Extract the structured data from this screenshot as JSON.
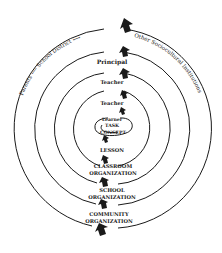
{
  "diagram": {
    "type": "concentric-circles",
    "center_spiral": {
      "lines": [
        "Learner",
        "TASK",
        "CONCEPT"
      ]
    },
    "top_labels": {
      "ring1": "Teacher",
      "ring2": "Teacher",
      "ring3": "Principal",
      "ring4_left_1": "Parents",
      "ring4_left_2": "School District",
      "ring4_right": "Other Sociocultural Institutions"
    },
    "bottom_labels": {
      "ring1": "LESSON",
      "ring2_line1": "CLASSROOM",
      "ring2_line2": "ORGANIZATION",
      "ring3_line1": "SCHOOL",
      "ring3_line2": "ORGANIZATION",
      "ring4_line1": "COMMUNITY",
      "ring4_line2": "ORGANIZATION"
    },
    "colors": {
      "line": "#1a1a1a",
      "background": "#ffffff"
    }
  }
}
